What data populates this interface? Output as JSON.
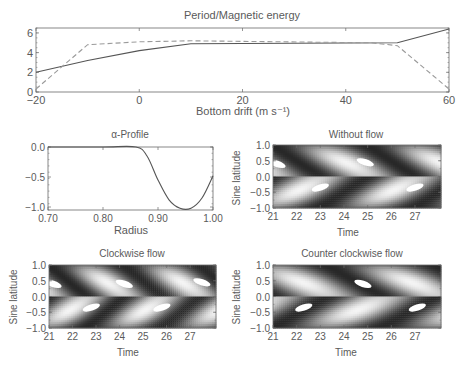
{
  "chart_data": [
    {
      "id": "top",
      "type": "line",
      "title": "Period/Magnetic energy",
      "xlabel": "Bottom drift (m s⁻¹)",
      "ylabel": "",
      "xlim": [
        -20,
        60
      ],
      "ylim": [
        0,
        6.5
      ],
      "xticks": [
        -20,
        0,
        20,
        40,
        60
      ],
      "yticks": [
        0,
        2,
        4,
        6
      ],
      "grid": false,
      "legend": null,
      "series": [
        {
          "name": "Period",
          "style": "solid",
          "x": [
            -20,
            -10,
            0,
            10,
            50,
            60
          ],
          "y": [
            2.0,
            3.2,
            4.2,
            4.9,
            5.0,
            6.4
          ]
        },
        {
          "name": "Magnetic energy",
          "style": "dashed",
          "x": [
            -20,
            -10,
            0,
            10,
            45,
            50,
            60
          ],
          "y": [
            0.3,
            4.8,
            5.1,
            5.2,
            5.0,
            4.7,
            0.3
          ]
        }
      ]
    },
    {
      "id": "alpha",
      "type": "line",
      "title": "α-Profile",
      "xlabel": "Radius",
      "ylabel": "",
      "xlim": [
        0.7,
        1.0
      ],
      "ylim": [
        -1.05,
        0.0
      ],
      "xticks": [
        "0.70",
        "0.80",
        "0.90",
        "1.00"
      ],
      "yticks": [
        "0.0",
        "-0.5",
        "-1.0"
      ],
      "series": [
        {
          "name": "alpha",
          "style": "solid",
          "x": [
            0.7,
            0.8,
            0.86,
            0.88,
            0.9,
            0.92,
            0.94,
            0.96,
            0.98,
            1.0
          ],
          "y": [
            0.0,
            0.0,
            0.0,
            -0.15,
            -0.55,
            -0.88,
            -1.02,
            -1.02,
            -0.85,
            -0.48
          ]
        }
      ]
    },
    {
      "id": "noflow",
      "type": "heatmap",
      "title": "Without flow",
      "xlabel": "Time",
      "ylabel": "Sine latitude",
      "xlim": [
        21,
        28.1
      ],
      "ylim": [
        -1.0,
        1.0
      ],
      "xticks": [
        21,
        22,
        23,
        24,
        25,
        26,
        27
      ],
      "yticks": [
        "1.0",
        "0.5",
        "0.0",
        "-0.5",
        "-1.0"
      ],
      "butterfly_period": 4.0,
      "phase": 0.0,
      "highlights": [
        {
          "t": 21.0,
          "lat": 0.4
        },
        {
          "t": 23.0,
          "lat": -0.35
        },
        {
          "t": 24.9,
          "lat": 0.45
        },
        {
          "t": 27.0,
          "lat": -0.35
        }
      ]
    },
    {
      "id": "clockwise",
      "type": "heatmap",
      "title": "Clockwise flow",
      "xlabel": "Time",
      "ylabel": "Sine latitude",
      "xlim": [
        21,
        28.1
      ],
      "ylim": [
        -1.0,
        1.0
      ],
      "xticks": [
        21,
        22,
        23,
        24,
        25,
        26,
        27
      ],
      "yticks": [
        "1.0",
        "0.5",
        "0.0",
        "-0.5",
        "-1.0"
      ],
      "butterfly_period": 3.2,
      "phase": 0.0,
      "highlights": [
        {
          "t": 21.1,
          "lat": 0.4
        },
        {
          "t": 22.8,
          "lat": -0.35
        },
        {
          "t": 24.2,
          "lat": 0.4
        },
        {
          "t": 25.8,
          "lat": -0.35
        },
        {
          "t": 27.5,
          "lat": 0.45
        }
      ]
    },
    {
      "id": "counterclockwise",
      "type": "heatmap",
      "title": "Counter clockwise flow",
      "xlabel": "Time",
      "ylabel": "Sine latitude",
      "xlim": [
        21,
        28.1
      ],
      "ylim": [
        -1.0,
        1.0
      ],
      "xticks": [
        21,
        22,
        23,
        24,
        25,
        26,
        27
      ],
      "yticks": [
        "1.0",
        "0.5",
        "0.0",
        "-0.5",
        "-1.0"
      ],
      "butterfly_period": 4.6,
      "phase": 0.5,
      "highlights": [
        {
          "t": 22.3,
          "lat": -0.35
        },
        {
          "t": 24.8,
          "lat": 0.4
        },
        {
          "t": 27.1,
          "lat": -0.35
        }
      ]
    }
  ],
  "colors": {
    "axis": "#6a6a6a",
    "line": "#555555",
    "dashed": "#9a9a9a",
    "text": "#5a5a5a"
  }
}
